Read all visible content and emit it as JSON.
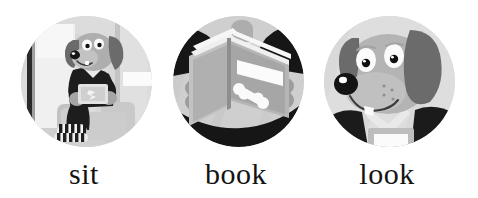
{
  "page": {
    "kind": "sight-word-flashcards",
    "background_color": "#ffffff",
    "caption_color": "#141414"
  },
  "palette": {
    "circle_bg": "#d9d9d9",
    "wall_light": "#ededed",
    "wall_mid": "#d2d2d2",
    "wall_shadow": "#bfbfbf",
    "dog_body": "#b0b0b0",
    "dog_ear": "#6e6e6e",
    "dark": "#1c1c1c",
    "white": "#ffffff",
    "chair": "#cfcfcf",
    "chair_shade": "#b4b4b4",
    "book_cover": "#a8a8a8",
    "book_page": "#e8e8e8",
    "paw": "#9a9a9a"
  },
  "cards": [
    {
      "id": "card-sit",
      "label": "sit",
      "image_name": "dog-sitting-in-chair-illustration",
      "image_alt": "Cartoon dog sitting in an armchair holding a book, wearing striped socks",
      "scene_elements": [
        "wall",
        "doorframe",
        "dog",
        "armchair",
        "striped-socks",
        "held-book"
      ]
    },
    {
      "id": "card-book",
      "label": "book",
      "image_name": "open-book-with-bone-cover-illustration",
      "image_alt": "An open book held up, its cover showing a white bone and a blank white label",
      "scene_elements": [
        "open-book",
        "book-pages",
        "bone-graphic",
        "blank-label",
        "paws"
      ]
    },
    {
      "id": "card-look",
      "label": "look",
      "image_name": "dog-face-closeup-illustration",
      "image_alt": "Close-up of a smiling cartoon dog face with floppy ears and a black nose",
      "scene_elements": [
        "dog-head",
        "floppy-ears",
        "eyes",
        "nose",
        "smiling-mouth",
        "tooth",
        "book-below"
      ]
    }
  ]
}
